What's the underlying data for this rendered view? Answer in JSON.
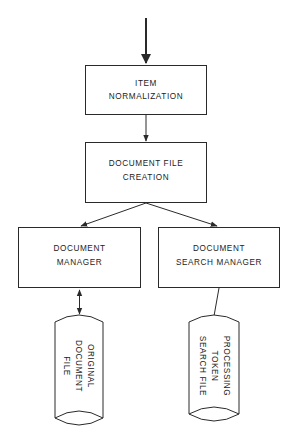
{
  "diagram": {
    "type": "flowchart",
    "nodes": {
      "item_normalization": {
        "line1": "ITEM",
        "line2": "NORMALIZATION"
      },
      "document_file_creation": {
        "line1": "DOCUMENT FILE",
        "line2": "CREATION"
      },
      "document_manager": {
        "line1": "DOCUMENT",
        "line2": "MANAGER"
      },
      "document_search_manager": {
        "line1": "DOCUMENT",
        "line2": "SEARCH MANAGER"
      },
      "original_document_file": {
        "line1": "ORIGINAL",
        "line2": "DOCUMENT",
        "line3": "FILE"
      },
      "processing_token_search_file": {
        "line1": "PROCESSING",
        "line2": "TOKEN",
        "line3": "SEARCH FILE"
      }
    },
    "edges": [
      {
        "from": "input",
        "to": "item_normalization",
        "style": "arrow"
      },
      {
        "from": "item_normalization",
        "to": "document_file_creation",
        "style": "arrow"
      },
      {
        "from": "document_file_creation",
        "to": "document_manager",
        "style": "arrow"
      },
      {
        "from": "document_file_creation",
        "to": "document_search_manager",
        "style": "arrow"
      },
      {
        "from": "document_manager",
        "to": "original_document_file",
        "style": "double-arrow"
      },
      {
        "from": "document_search_manager",
        "to": "processing_token_search_file",
        "style": "line"
      }
    ],
    "colors": {
      "stroke": "#2a2a2a",
      "background": "#ffffff"
    }
  }
}
